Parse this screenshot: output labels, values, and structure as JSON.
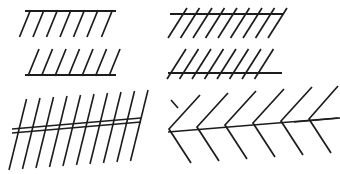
{
  "figure": {
    "background_color": "#ffffff",
    "ink_color": "#1c1c1c",
    "width": 340,
    "height": 174,
    "panel_count": 4
  },
  "panels": [
    {
      "id": "top-left",
      "name": "horizontal-line-with-backslash-hatches-below",
      "description": "Single horizontal rule with oblique strokes descending to the left below it",
      "baseline": {
        "x1": 25,
        "y1": 11,
        "x2": 115,
        "y2": 11
      },
      "hatch_count": 7,
      "hatch_angle_deg": -68,
      "hatch_length": 30,
      "hatch_spacing": 13.5,
      "hatch_first_x": 30,
      "hatch_direction": "down-left",
      "crosses_baseline": false
    },
    {
      "id": "mid-left",
      "name": "horizontal-line-with-forwardslash-hatches-above",
      "description": "Single horizontal rule with oblique strokes ascending to the right above it",
      "baseline": {
        "x1": 25,
        "y1": 75,
        "x2": 115,
        "y2": 75
      },
      "hatch_count": 7,
      "hatch_angle_deg": 68,
      "hatch_length": 30,
      "hatch_spacing": 13.5,
      "hatch_first_x": 28,
      "hatch_direction": "up-right",
      "crosses_baseline": false
    },
    {
      "id": "top-right",
      "name": "horizontal-line-with-backslash-hatches-crossing",
      "description": "Single horizontal rule crossed by oblique strokes running down to the left",
      "baseline": {
        "x1": 176,
        "y1": 14,
        "x2": 272,
        "y2": 14
      },
      "hatch_count": 8,
      "hatch_angle_deg": -58,
      "hatch_length": 36,
      "hatch_spacing": 13.0,
      "hatch_first_x": 181,
      "hatch_direction": "down-left",
      "crosses_baseline": true
    },
    {
      "id": "mid-right",
      "name": "horizontal-line-with-forwardslash-hatches-crossing",
      "description": "Single horizontal rule crossed by oblique strokes running up to the right",
      "baseline": {
        "x1": 172,
        "y1": 73,
        "x2": 270,
        "y2": 73
      },
      "hatch_count": 8,
      "hatch_angle_deg": 58,
      "hatch_length": 36,
      "hatch_spacing": 13.0,
      "hatch_first_x": 176,
      "hatch_direction": "up-right",
      "crosses_baseline": true
    },
    {
      "id": "bottom-left",
      "name": "two-oblique-lines-with-steep-hatches",
      "description": "Two long parallel oblique lines crossed by steep near-vertical hatch strokes",
      "oblique_lines": [
        {
          "x1": 13,
          "y1": 128,
          "x2": 140,
          "y2": 117
        },
        {
          "x1": 13,
          "y1": 131,
          "x2": 140,
          "y2": 120
        }
      ],
      "hatch_count": 10,
      "hatch_angle_deg": 76,
      "hatch_length": 74,
      "hatch_spacing": 13.6,
      "hatch_first_x": 18,
      "crosses_baseline": true
    },
    {
      "id": "bottom-right",
      "name": "two-oblique-lines-with-chevron-hatches",
      "description": "Two long oblique lines crossed by chevron-shaped hatches pointing left",
      "oblique_lines": [
        {
          "x1": 168,
          "y1": 131,
          "x2": 330,
          "y2": 118
        }
      ],
      "chevron_count": 6,
      "chevron_arm_length": 46,
      "chevron_half_angle_deg": 45,
      "chevron_spacing": 27.5,
      "chevron_first_x": 182,
      "chevron_apex_side": "left"
    }
  ],
  "labels": {
    "caption": ""
  }
}
